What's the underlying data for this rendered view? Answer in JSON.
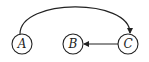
{
  "diagram": {
    "nodes": [
      {
        "id": "A",
        "label": "A",
        "cx": 22,
        "cy": 44
      },
      {
        "id": "B",
        "label": "B",
        "cx": 73,
        "cy": 44
      },
      {
        "id": "C",
        "label": "C",
        "cx": 128,
        "cy": 44
      }
    ],
    "edges": [
      {
        "from": "A",
        "to": "C",
        "style": "curved-over"
      },
      {
        "from": "C",
        "to": "B",
        "style": "straight"
      }
    ],
    "colors": {
      "stroke": "#222222",
      "background": "#ffffff"
    }
  }
}
